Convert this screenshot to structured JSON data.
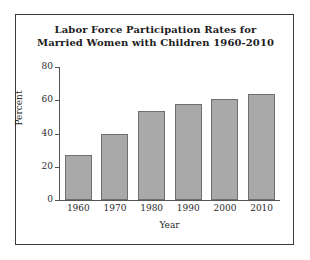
{
  "chart_data": {
    "type": "bar",
    "title": "Labor Force Participation Rates for Married Women with Children 1960-2010",
    "title_lines": [
      "Labor Force Participation Rates for",
      "Married Women with Children 1960-2010"
    ],
    "xlabel": "Year",
    "ylabel": "Percent",
    "categories": [
      "1960",
      "1970",
      "1980",
      "1990",
      "2000",
      "2010"
    ],
    "values": [
      27,
      39.5,
      53.5,
      57.5,
      61,
      64
    ],
    "ylim": [
      0,
      80
    ],
    "ytick_labels": [
      "0",
      "20",
      "40",
      "60",
      "80"
    ],
    "ytick_values": [
      0,
      20,
      40,
      60,
      80
    ],
    "grid": false,
    "legend": "none",
    "bar_color": "#a9a9a9",
    "bar_border_color": "#6f6f6f",
    "axis_color": "#555555",
    "text_color": "#2b2b2b",
    "background_color": "#ffffff",
    "frame_color": "#3a3a3a"
  }
}
